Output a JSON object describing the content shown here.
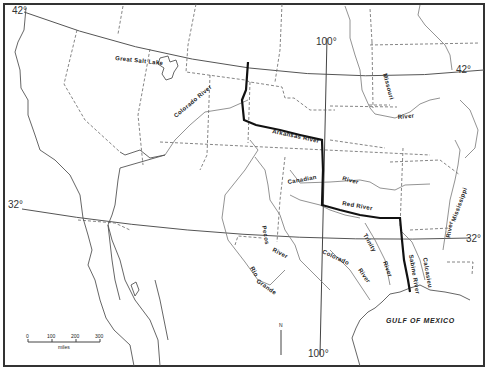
{
  "map": {
    "title": "",
    "latitude_labels": [
      {
        "id": "lat42-left",
        "text": "42°"
      },
      {
        "id": "lat42-right",
        "text": "42°"
      },
      {
        "id": "lat32-left",
        "text": "32°"
      },
      {
        "id": "lat32-right",
        "text": "32°"
      }
    ],
    "longitude_labels": [
      {
        "id": "lon100-top",
        "text": "100°"
      },
      {
        "id": "lon100-bottom",
        "text": "100°"
      }
    ],
    "water_bodies": [
      {
        "id": "great-salt-lake",
        "text": "Great Salt Lake"
      },
      {
        "id": "gulf-of-mexico",
        "text": "GULF OF MEXICO"
      }
    ],
    "rivers": [
      {
        "id": "colorado-river-north",
        "text": "Colorado River"
      },
      {
        "id": "arkansas-river",
        "text": "Arkansas River"
      },
      {
        "id": "missouri",
        "text": "Missouri"
      },
      {
        "id": "missouri-river",
        "text": "River"
      },
      {
        "id": "canadian",
        "text": "Canadian"
      },
      {
        "id": "canadian-river",
        "text": "River"
      },
      {
        "id": "red-river",
        "text": "Red River"
      },
      {
        "id": "mississippi",
        "text": "Mississippi"
      },
      {
        "id": "mississippi-river",
        "text": "River"
      },
      {
        "id": "pecos",
        "text": "Pecos"
      },
      {
        "id": "pecos-river",
        "text": "River"
      },
      {
        "id": "rio",
        "text": "Rio"
      },
      {
        "id": "grande",
        "text": "Grande"
      },
      {
        "id": "colorado-south",
        "text": "Colorado"
      },
      {
        "id": "colorado-south-river",
        "text": "River"
      },
      {
        "id": "trinity",
        "text": "Trinity"
      },
      {
        "id": "trinity-river",
        "text": "River"
      },
      {
        "id": "sabine-river",
        "text": "Sabine River"
      },
      {
        "id": "calcasieu",
        "text": "Calcasieu"
      }
    ],
    "scale": {
      "ticks": [
        "0",
        "100",
        "200",
        "300"
      ],
      "unit": "miles"
    },
    "north_arrow": "N",
    "colors": {
      "background": "#ffffff",
      "line": "#555555",
      "boundary": "#111111"
    }
  }
}
